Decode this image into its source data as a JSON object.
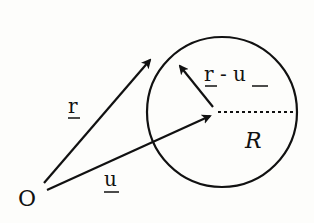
{
  "diagram": {
    "origin_label": "O",
    "labels": {
      "r": "r",
      "u": "u",
      "r_minus_u": "r - u",
      "radius": "R"
    },
    "colors": {
      "stroke": "#111111",
      "background": "#fdfdfb"
    }
  }
}
